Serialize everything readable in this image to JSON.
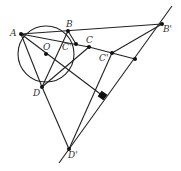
{
  "diagram": {
    "type": "geometry",
    "circle": {
      "center": "O",
      "cx": 46,
      "cy": 54,
      "r": 28
    },
    "points": {
      "A": {
        "label": "A",
        "x": 21,
        "y": 34
      },
      "B": {
        "label": "B",
        "x": 68,
        "y": 31
      },
      "Cp": {
        "label": "C'",
        "x": 76,
        "y": 44
      },
      "C": {
        "label": "C",
        "x": 89,
        "y": 47
      },
      "O": {
        "label": "O",
        "x": 46,
        "y": 54
      },
      "D": {
        "label": "D",
        "x": 42,
        "y": 87
      },
      "Bp": {
        "label": "B'",
        "x": 162,
        "y": 24
      },
      "Cpp": {
        "label": "C'",
        "x": 112,
        "y": 53
      },
      "E": {
        "label": "",
        "x": 135,
        "y": 59
      },
      "F": {
        "label": "",
        "x": 103,
        "y": 96
      },
      "Dp": {
        "label": "D'",
        "x": 69,
        "y": 149
      }
    },
    "labels": {
      "A": "A",
      "B": "B",
      "Cp": "C'",
      "C": "C",
      "O": "O",
      "D": "D",
      "Bp": "B'",
      "Cpp": "C'",
      "Dp": "D'"
    }
  }
}
